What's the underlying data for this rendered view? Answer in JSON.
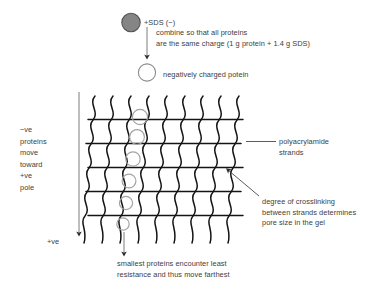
{
  "figure": {
    "background_color": "#ffffff",
    "line_color": "#1a1a1a",
    "text_color": "#3d3d3d",
    "protein_fill_color": "#808080",
    "protein_outline_color": "#4d4d4d",
    "gel_protein_color": "#9a9a9a"
  },
  "top": {
    "sds_label": "+SDS (−)",
    "explanation_line_1": "combine so that all proteins",
    "explanation_line_2": "are the same charge (1 g protein + 1.4 g SDS)",
    "product_label": "negatively charged potein",
    "raw_protein_icon": "filled-protein-circle",
    "charged_protein_icon": "open-protein-circle",
    "arrow_icon": "down-arrow"
  },
  "left": {
    "migration_note": "−ve\nproteins\nmove\ntoward\n+ve\npole",
    "pole_label": "+ve",
    "arrow_icon": "down-arrow-long"
  },
  "right": {
    "strands_label": "polyacrylamide\nstrands",
    "crosslink_note": "degree of crosslinking\nbetween strands determines\npore size in the gel",
    "strands_leader_icon": "leader-line-horizontal",
    "crosslink_leader_icon": "leader-line-diagonal"
  },
  "bottom": {
    "caption": "smallest proteins encounter least\nresistance and thus move farthest",
    "arrow_icon": "down-arrow"
  },
  "gel": {
    "strand_count": 9,
    "crosslink_count": 5,
    "protein_count": 6,
    "description": "polyacrylamide mesh of wavy vertical strands joined by horizontal crosslinks"
  }
}
